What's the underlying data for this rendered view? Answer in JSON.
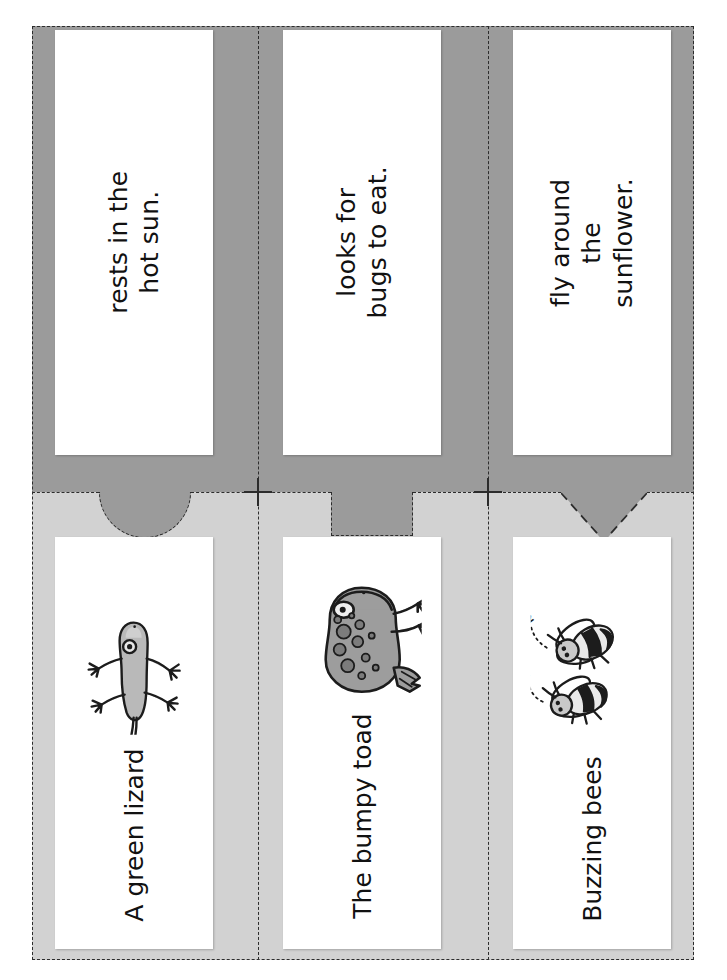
{
  "worksheet": {
    "title": "Sentence match cut-and-paste strips",
    "colors": {
      "band_top": "#9b9b9b",
      "band_bottom": "#d2d2d2",
      "card": "#ffffff",
      "cut_line": "#2c2c2c",
      "text": "#111111"
    }
  },
  "top_row": {
    "cards": [
      {
        "text": "rests in the hot sun."
      },
      {
        "text": "looks for bugs to eat."
      },
      {
        "text": "fly around the\nsunflower."
      }
    ]
  },
  "bottom_row": {
    "cards": [
      {
        "label": "A green lizard",
        "art": "lizard-illustration"
      },
      {
        "label": "The bumpy toad",
        "art": "toad-illustration"
      },
      {
        "label": "Buzzing bees",
        "art": "bees-illustration"
      }
    ]
  },
  "tabs": [
    {
      "shape": "semicircle"
    },
    {
      "shape": "rectangle"
    },
    {
      "shape": "triangle"
    }
  ],
  "registration_marks": [
    {
      "name": "crosshair-left"
    },
    {
      "name": "crosshair-right"
    }
  ]
}
